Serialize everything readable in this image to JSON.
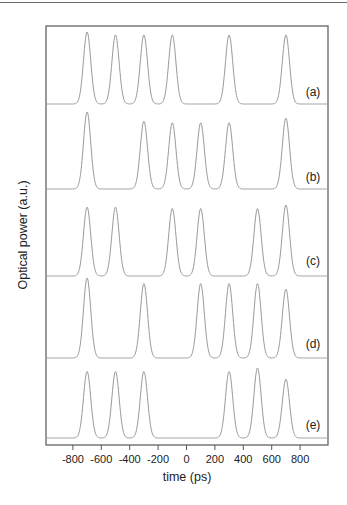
{
  "chart_data": {
    "type": "line",
    "title": "",
    "xlabel": "time (ps)",
    "ylabel": "Optical power (a.u.)",
    "xlim": [
      -1000,
      980
    ],
    "x_ticks": [
      -800,
      -600,
      -400,
      -200,
      0,
      200,
      400,
      600,
      800
    ],
    "x_tick_labels": [
      "-800",
      "-600",
      "-400",
      "-200",
      "0",
      "200",
      "400",
      "600",
      "800"
    ],
    "grid": false,
    "legend": "none",
    "pulse_fwhm_ps": 60,
    "series": [
      {
        "name": "(a)",
        "pulse_centers_ps": [
          -700,
          -500,
          -300,
          -100,
          300,
          700
        ],
        "relative_heights": [
          1.0,
          0.96,
          0.96,
          0.96,
          0.96,
          0.96
        ]
      },
      {
        "name": "(b)",
        "pulse_centers_ps": [
          -700,
          -300,
          -100,
          100,
          300,
          700
        ],
        "relative_heights": [
          1.0,
          0.88,
          0.86,
          0.86,
          0.86,
          0.92
        ]
      },
      {
        "name": "(c)",
        "pulse_centers_ps": [
          -700,
          -500,
          -100,
          100,
          500,
          700
        ],
        "relative_heights": [
          0.97,
          0.97,
          0.95,
          0.95,
          0.95,
          1.0
        ]
      },
      {
        "name": "(d)",
        "pulse_centers_ps": [
          -700,
          -300,
          100,
          300,
          500,
          700
        ],
        "relative_heights": [
          1.0,
          0.93,
          0.93,
          0.93,
          0.93,
          0.86
        ]
      },
      {
        "name": "(e)",
        "pulse_centers_ps": [
          -700,
          -500,
          -300,
          300,
          500,
          700
        ],
        "relative_heights": [
          0.95,
          0.95,
          0.95,
          0.95,
          1.0,
          0.84
        ]
      }
    ]
  },
  "layout": {
    "plot_box": {
      "x0": 46,
      "y0": 26,
      "x1": 328,
      "y1": 445
    },
    "x_zero_px": 186.5,
    "px_per_ps": 0.142,
    "traces": [
      {
        "baseline_px": 104,
        "peak_px": 32,
        "label_y": 96
      },
      {
        "baseline_px": 189,
        "peak_px": 112,
        "label_y": 181
      },
      {
        "baseline_px": 276,
        "peak_px": 205,
        "label_y": 265
      },
      {
        "baseline_px": 358,
        "peak_px": 278,
        "label_y": 348
      },
      {
        "baseline_px": 438,
        "peak_px": 368,
        "label_y": 429
      }
    ]
  },
  "panel_labels": [
    "(a)",
    "(b)",
    "(c)",
    "(d)",
    "(e)"
  ]
}
